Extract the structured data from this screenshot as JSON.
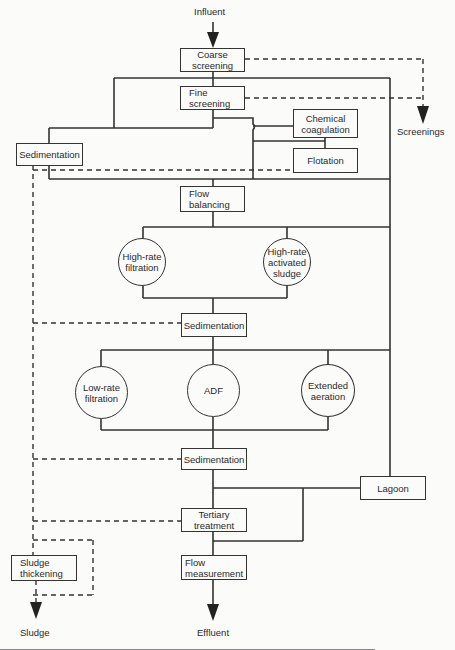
{
  "diagram": {
    "type": "process-flow",
    "influent_label": "Influent",
    "screenings_label": "Screenings",
    "sludge_label": "Sludge",
    "effluent_label": "Effluent",
    "nodes": {
      "coarse_screening": "Coarse\nscreening",
      "fine_screening": "Fine\nscreening",
      "chemical_coagulation": "Chemical\ncoagulation",
      "flotation": "Flotation",
      "sedimentation_primary": "Sedimentation",
      "flow_balancing": "Flow\nbalancing",
      "high_rate_filtration": "High-rate\nfiltration",
      "high_rate_activated_sludge": "High-rate\nactivated\nsludge",
      "sedimentation_secondary": "Sedimentation",
      "low_rate_filtration": "Low-rate\nfiltration",
      "adf": "ADF",
      "extended_aeration": "Extended\naeration",
      "sedimentation_final": "Sedimentation",
      "lagoon": "Lagoon",
      "tertiary_treatment": "Tertiary\ntreatment",
      "flow_measurement": "Flow\nmeasurement",
      "sludge_thickening": "Sludge\nthickening"
    },
    "legend": {
      "solid_line": "liquid flow",
      "dashed_line": "screenings / sludge flow"
    },
    "colors": {
      "line": "#333333",
      "background": "#fbfbfa"
    }
  }
}
